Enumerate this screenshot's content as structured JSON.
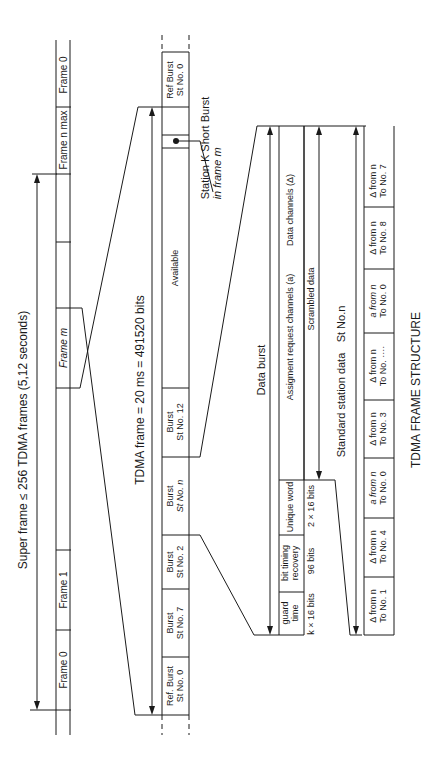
{
  "title": "TDMA FRAME STRUCTURE",
  "superframe": {
    "label": "Super frame ≤ 256 TDMA frames (5,12 seconds)",
    "frames": [
      {
        "label": "Frame 0"
      },
      {
        "label": "Frame 1"
      },
      {
        "label": ""
      },
      {
        "label": "Frame m"
      },
      {
        "label": ""
      },
      {
        "label": "Frame n max"
      },
      {
        "label": "Frame 0"
      }
    ]
  },
  "tdma_frame": {
    "label": "TDMA frame = 20 ms = 491520 bits",
    "bursts": [
      {
        "line1": "Ref. Burst",
        "line2": "St No. 0"
      },
      {
        "line1": "Burst",
        "line2": "St No. 7"
      },
      {
        "line1": "Burst",
        "line2": "St No. 2"
      },
      {
        "line1": "Burst",
        "line2": "St No. n"
      },
      {
        "line1": "Burst",
        "line2": "St No. 12"
      },
      {
        "line1": "Available",
        "line2": ""
      },
      {
        "line1": "",
        "line2": ""
      },
      {
        "line1": "",
        "line2": ""
      },
      {
        "line1": "Ref Burst",
        "line2": "St No. 0"
      }
    ],
    "short_burst_note": {
      "line1": "Station K Short Burst",
      "line2": "in frame m"
    }
  },
  "data_burst": {
    "label": "Data burst",
    "fields": [
      {
        "line1": "guard",
        "line2": "time",
        "size": "k × 16 bits"
      },
      {
        "line1": "bit timing",
        "line2": "recovery",
        "size": "96 bits"
      },
      {
        "line1": "Unique word",
        "line2": "",
        "size": "2 × 16 bits"
      }
    ],
    "assignment_label": "Assigment request channels (a)",
    "data_channels_label": "Data channels (Δ)",
    "scrambled_label": "Scrambled data"
  },
  "standard_station": {
    "label": "Standard station data",
    "station": "St No.n",
    "cells": [
      {
        "line1": "Δ from n",
        "line2": "To No. 1"
      },
      {
        "line1": "Δ from n",
        "line2": "To No. 4"
      },
      {
        "line1": "a from n",
        "line2": "To No. 0"
      },
      {
        "line1": "Δ from n",
        "line2": "To No. 3"
      },
      {
        "line1": "Δ from n",
        "line2": "To No. ····"
      },
      {
        "line1": "a from n",
        "line2": "To No. 0"
      },
      {
        "line1": "Δ from n",
        "line2": "To No. 8"
      },
      {
        "line1": "Δ from n",
        "line2": "To No. 7"
      },
      {
        "line1": "a from n",
        "line2": "To No. 0"
      }
    ]
  }
}
